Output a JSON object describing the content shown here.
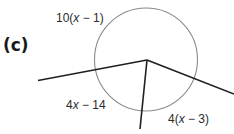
{
  "part_label": "(c)",
  "arcs": {
    "top": {
      "prefix": "10(",
      "var": "x",
      "suffix": " − 1)"
    },
    "left": {
      "prefix": "4",
      "var": "x",
      "suffix": " − 14"
    },
    "bottom_right": {
      "prefix": "4(",
      "var": "x",
      "suffix": " − 3)"
    }
  },
  "colors": {
    "circle": "#8a8a8a",
    "lines": "#1f1f1f",
    "text": "#2b2b2b"
  }
}
